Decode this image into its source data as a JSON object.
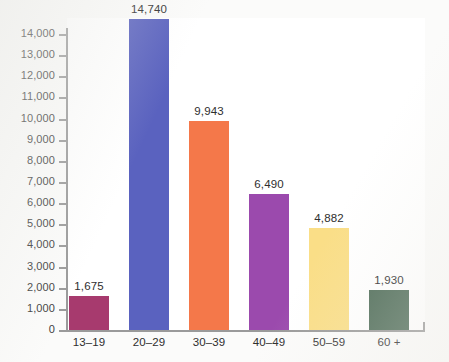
{
  "chart_data": {
    "type": "bar",
    "title": "",
    "subtitle": "",
    "xlabel": "",
    "ylabel": "",
    "categories": [
      "13–19",
      "20–29",
      "30–39",
      "40–49",
      "50–59",
      "60 +"
    ],
    "values": [
      1675,
      14740,
      9943,
      6490,
      4882,
      1930
    ],
    "value_labels": [
      "1,675",
      "14,740",
      "9,943",
      "6,490",
      "4,882",
      "1,930"
    ],
    "colors": [
      "#a73a6e",
      "#5a62bf",
      "#f4784a",
      "#9b4aad",
      "#fade87",
      "#4d6b57"
    ],
    "ylim": [
      0,
      14000
    ],
    "ytick_values": [
      0,
      1000,
      2000,
      3000,
      4000,
      5000,
      6000,
      7000,
      8000,
      9000,
      10000,
      11000,
      12000,
      13000,
      14000
    ],
    "ytick_labels": [
      "0",
      "1,000",
      "2,000",
      "3,000",
      "4,000",
      "5,000",
      "6,000",
      "7,000",
      "8,000",
      "9,000",
      "10,000",
      "11,000",
      "12,000",
      "13,000",
      "14,000"
    ],
    "grid": false,
    "legend": false,
    "legend_position": "none",
    "axis_color": "#9a9a9a",
    "plot_background": "#ffffff"
  }
}
